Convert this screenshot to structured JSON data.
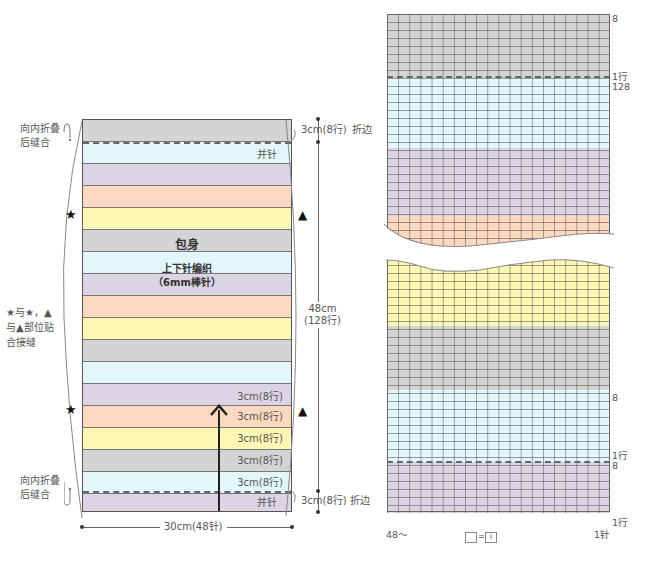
{
  "colors": {
    "gray": "#d4d4d4",
    "light_blue": "#e3f6fb",
    "purple": "#dcd3e4",
    "orange": "#fbd9c0",
    "yellow": "#fdf6b5",
    "outline": "#555555"
  },
  "schematic": {
    "title": "包身",
    "technique": "上下针编织",
    "needle": "（6mm棒针）",
    "stripes": [
      {
        "color": "gray",
        "height": 22
      },
      {
        "color": "light_blue",
        "height": 22
      },
      {
        "color": "purple",
        "height": 22
      },
      {
        "color": "orange",
        "height": 22
      },
      {
        "color": "yellow",
        "height": 22
      },
      {
        "color": "gray",
        "height": 22
      },
      {
        "color": "light_blue",
        "height": 22
      },
      {
        "color": "purple",
        "height": 22
      },
      {
        "color": "orange",
        "height": 22
      },
      {
        "color": "yellow",
        "height": 22
      },
      {
        "color": "gray",
        "height": 22
      },
      {
        "color": "light_blue",
        "height": 22
      },
      {
        "color": "purple",
        "height": 22
      },
      {
        "color": "orange",
        "height": 22
      },
      {
        "color": "yellow",
        "height": 22
      },
      {
        "color": "gray",
        "height": 22
      },
      {
        "color": "light_blue",
        "height": 22
      },
      {
        "color": "purple",
        "height": 22
      }
    ],
    "left_notes": {
      "top_fold": "向内折叠\n后缝合",
      "middle": "★与★，▲\n与▲部位贴\n合接缝",
      "bottom_fold": "向内折叠\n后缝合",
      "star": "★"
    },
    "right_marks": {
      "triangle": "▲",
      "bind_off_top": "并针",
      "bind_off_bottom": "并针",
      "top_measure": "3cm(8行)",
      "top_fold": "折边",
      "total_height": "48cm",
      "total_rows": "(128行)",
      "bottom_measure": "3cm(8行)",
      "bottom_fold": "折边",
      "stripe_measures": [
        "3cm(8行)",
        "3cm(8行)",
        "3cm(8行)",
        "3cm(8行)",
        "3cm(8行)"
      ]
    },
    "width_label": "30cm(48针)"
  },
  "chart": {
    "top_panel": {
      "labels": {
        "top": "8",
        "row1": "1行",
        "row128": "128"
      }
    },
    "bottom_panel": {
      "labels": {
        "eight_upper": "8",
        "row1": "1行",
        "eight_lower": "8",
        "row1_bottom": "1行"
      }
    },
    "x_left": "48～",
    "x_right": "1针",
    "legend": {
      "symbol_text": "=",
      "knit_symbol": "I"
    }
  }
}
